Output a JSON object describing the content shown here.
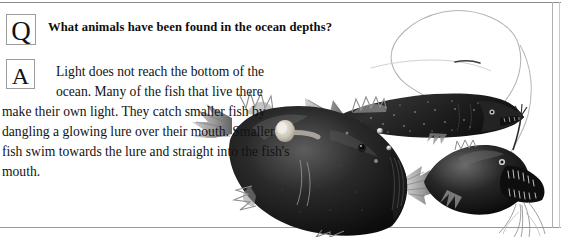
{
  "panel": {
    "question_badge": "Q",
    "answer_badge": "A",
    "question": "What animals have been found in the ocean depths?",
    "answer": "Light does not reach the bottom of the ocean. Many of the fish that live there make their own light. They catch smaller fish by dangling a glowing lure over their mouth. Smaller fish swim towards the lure and straight into the fish's mouth.",
    "illustration_caption": "deep sea anglerfish, dragonfish and fangtooth illustrations"
  },
  "colors": {
    "text": "#121212",
    "rule": "#8d8d8d",
    "badge_border": "#9c9c9c",
    "background": "#ffffff",
    "fish_dark": "#151515",
    "fish_mid": "#4a4a4a",
    "fish_light": "#b9b9b9",
    "lure_glow": "#d8d4cc"
  }
}
